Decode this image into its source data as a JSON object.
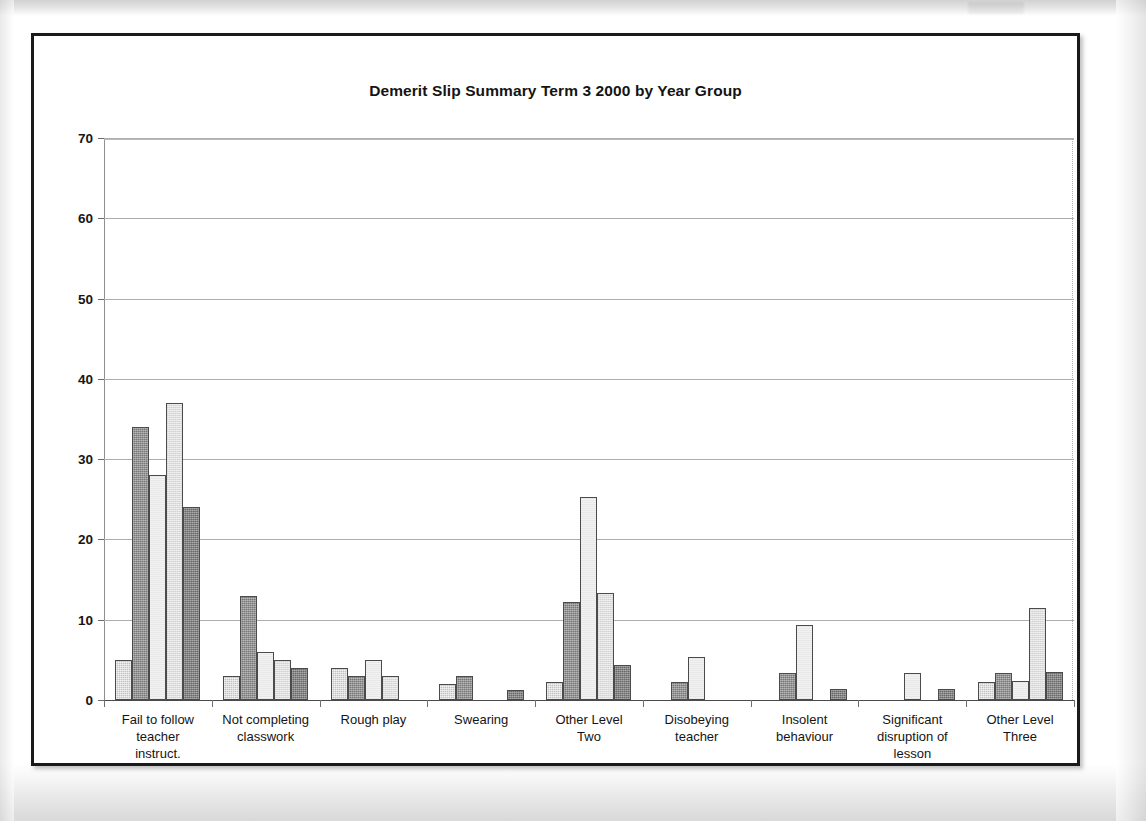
{
  "document": {
    "kind": "scanned-chart-page",
    "frame_border_color": "#1a1a1a",
    "background_color": "#ffffff"
  },
  "chart_data": {
    "type": "bar",
    "title": "Demerit Slip Summary Term 3 2000  by Year Group",
    "xlabel": "",
    "ylabel": "",
    "ylim": [
      0,
      70
    ],
    "yticks": [
      "0",
      "10",
      "20",
      "30",
      "40",
      "50",
      "60",
      "70"
    ],
    "ytick_values": [
      0,
      10,
      20,
      30,
      40,
      50,
      60,
      70
    ],
    "grid": true,
    "legend": "none",
    "grouping": "clustered",
    "categories": [
      "Fail to follow teacher instruct.",
      "Not completing classwork",
      "Rough play",
      "Swearing",
      "Other Level Two",
      "Disobeying teacher",
      "Insolent behaviour",
      "Significant disruption of lesson",
      "Other Level Three"
    ],
    "category_lines": [
      [
        "Fail to follow",
        "teacher",
        "instruct."
      ],
      [
        "Not completing",
        "classwork"
      ],
      [
        "Rough play"
      ],
      [
        "Swearing"
      ],
      [
        "Other Level",
        "Two"
      ],
      [
        "Disobeying",
        "teacher"
      ],
      [
        "Insolent",
        "behaviour"
      ],
      [
        "Significant",
        "disruption of",
        "lesson"
      ],
      [
        "Other Level",
        "Three"
      ]
    ],
    "series": [
      {
        "name": "Year Group 1",
        "fill": "#c3c3c3",
        "values": [
          5,
          3,
          4,
          2,
          2.2,
          0,
          0,
          0,
          2.3
        ]
      },
      {
        "name": "Year Group 2",
        "fill": "#777777",
        "values": [
          34,
          13,
          3,
          3,
          12.2,
          2.2,
          3.4,
          0,
          3.4
        ]
      },
      {
        "name": "Year Group 3",
        "fill": "#f2f2f2",
        "values": [
          28,
          6,
          5,
          0,
          25.3,
          5.3,
          9.3,
          3.4,
          2.4
        ]
      },
      {
        "name": "Year Group 4",
        "fill": "#dedede",
        "values": [
          37,
          5,
          3,
          0,
          13.3,
          0,
          0,
          0,
          11.5
        ]
      },
      {
        "name": "Year Group 5",
        "fill": "#686868",
        "values": [
          24,
          4,
          0,
          1.2,
          4.3,
          0,
          1.4,
          1.4,
          3.5
        ]
      }
    ]
  }
}
